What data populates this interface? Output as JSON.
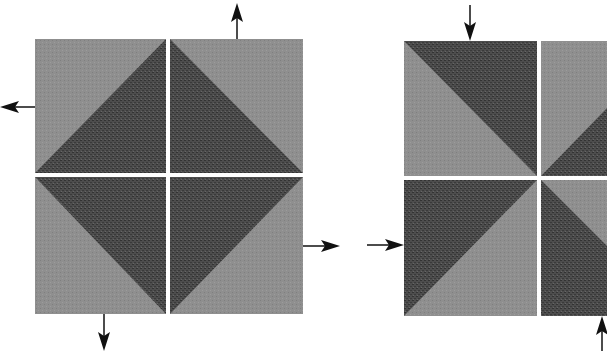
{
  "figure": {
    "colors": {
      "background": "#ffffff",
      "light_fabric": "#8e8e8e",
      "dark_fabric": "#4a4a4a",
      "gutter": "#ffffff",
      "arrow": "#111111"
    },
    "blocks": [
      {
        "id": "left-block",
        "pattern": "diamond (square-in-square)",
        "arrows": [
          {
            "position": "top",
            "direction": "up"
          },
          {
            "position": "left",
            "direction": "left"
          },
          {
            "position": "right",
            "direction": "right"
          },
          {
            "position": "bottom",
            "direction": "down"
          }
        ]
      },
      {
        "id": "right-block",
        "pattern": "pinwheel",
        "arrows": [
          {
            "position": "top",
            "direction": "down"
          },
          {
            "position": "left",
            "direction": "right"
          },
          {
            "position": "bottom",
            "direction": "up"
          }
        ]
      }
    ]
  }
}
